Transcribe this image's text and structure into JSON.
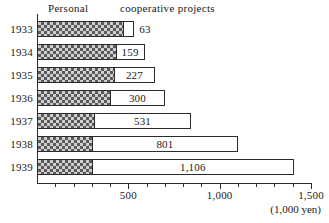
{
  "chart_data": {
    "type": "bar",
    "orientation": "horizontal",
    "stacked": true,
    "title": "",
    "xlabel": "(1,000 yen)",
    "ylabel": "",
    "xlim": [
      0,
      1500
    ],
    "grid": false,
    "legend_position": "top",
    "categories": [
      "1933",
      "1934",
      "1935",
      "1936",
      "1937",
      "1938",
      "1939"
    ],
    "series": [
      {
        "name": "Personal",
        "values": [
          470,
          430,
          420,
          400,
          312,
          300,
          300
        ]
      },
      {
        "name": "cooperative projects",
        "values": [
          63,
          159,
          227,
          300,
          531,
          801,
          1106
        ]
      }
    ],
    "data_labels": [
      "63",
      "159",
      "227",
      "300",
      "531",
      "801",
      "1,106"
    ],
    "tick_labels": [
      "500",
      "1,000",
      "1,500"
    ],
    "tick_values": [
      500,
      1000,
      1500
    ],
    "minor_tick_values": [
      100,
      200,
      300,
      400,
      600,
      700,
      800,
      900,
      1100,
      1200,
      1300,
      1400
    ],
    "axis_color": "#2b2b2b",
    "hatch_color": "#5a5a5a",
    "fill_color": "#ffffff"
  },
  "legend": {
    "personal": "Personal",
    "cooperative": "cooperative projects"
  },
  "axis": {
    "unit": "(1,000 yen)"
  },
  "rows": [
    {
      "year": "1933",
      "label": "63",
      "personal": 470,
      "total": 533,
      "label_inside": false
    },
    {
      "year": "1934",
      "label": "159",
      "personal": 430,
      "total": 589,
      "label_inside": true
    },
    {
      "year": "1935",
      "label": "227",
      "personal": 420,
      "total": 647,
      "label_inside": true
    },
    {
      "year": "1936",
      "label": "300",
      "personal": 400,
      "total": 700,
      "label_inside": true
    },
    {
      "year": "1937",
      "label": "531",
      "personal": 312,
      "total": 843,
      "label_inside": true
    },
    {
      "year": "1938",
      "label": "801",
      "personal": 300,
      "total": 1101,
      "label_inside": true
    },
    {
      "year": "1939",
      "label": "1,106",
      "personal": 300,
      "total": 1406,
      "label_inside": true
    }
  ],
  "ticks": [
    {
      "value": 100,
      "major": false,
      "label": ""
    },
    {
      "value": 200,
      "major": false,
      "label": ""
    },
    {
      "value": 300,
      "major": false,
      "label": ""
    },
    {
      "value": 400,
      "major": false,
      "label": ""
    },
    {
      "value": 500,
      "major": true,
      "label": "500"
    },
    {
      "value": 600,
      "major": false,
      "label": ""
    },
    {
      "value": 700,
      "major": false,
      "label": ""
    },
    {
      "value": 800,
      "major": false,
      "label": ""
    },
    {
      "value": 900,
      "major": false,
      "label": ""
    },
    {
      "value": 1000,
      "major": true,
      "label": "1,000"
    },
    {
      "value": 1100,
      "major": false,
      "label": ""
    },
    {
      "value": 1200,
      "major": false,
      "label": ""
    },
    {
      "value": 1300,
      "major": false,
      "label": ""
    },
    {
      "value": 1400,
      "major": false,
      "label": ""
    },
    {
      "value": 1500,
      "major": true,
      "label": "1,500"
    }
  ]
}
